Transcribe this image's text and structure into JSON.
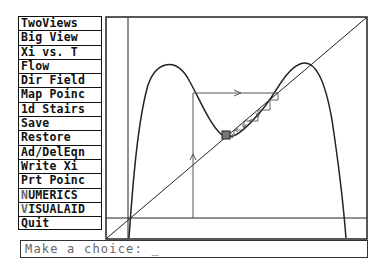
{
  "menu": {
    "items": [
      {
        "label": "TwoViews"
      },
      {
        "label": "Big View"
      },
      {
        "label": "Xi vs. T"
      },
      {
        "label": "Flow"
      },
      {
        "label": "Dir Field"
      },
      {
        "label": "Map Poinc"
      },
      {
        "label": "1d Stairs"
      },
      {
        "label": "Save"
      },
      {
        "label": "Restore"
      },
      {
        "label": "Ad/DelEqn"
      },
      {
        "label": "Write Xi"
      },
      {
        "label": "Prt Poinc"
      },
      {
        "label": "NUMERICS",
        "hotkey": "N",
        "rest": "UMERICS"
      },
      {
        "label": "VISUALAID",
        "hotkey": "V",
        "rest": "ISUALAID"
      },
      {
        "label": "Quit"
      }
    ]
  },
  "prompt": {
    "text": "Make a choice: ",
    "cursor": "_"
  },
  "plot": {
    "description": "1d stairs (cobweb) plot of a double-hump map with diagonal y=x",
    "frame_color": "#222222",
    "curve_color": "#222222",
    "cobweb_color": "#555555"
  }
}
